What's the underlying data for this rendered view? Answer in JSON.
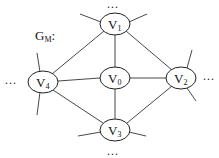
{
  "graph": {
    "label": {
      "main": "G",
      "sub": "M",
      "suffix": ":"
    },
    "nodes": [
      {
        "id": "v0",
        "main": "V",
        "sub": "0"
      },
      {
        "id": "v1",
        "main": "V",
        "sub": "1"
      },
      {
        "id": "v2",
        "main": "V",
        "sub": "2"
      },
      {
        "id": "v3",
        "main": "V",
        "sub": "3"
      },
      {
        "id": "v4",
        "main": "V",
        "sub": "4"
      }
    ],
    "edges": [
      [
        "v1",
        "v0"
      ],
      [
        "v1",
        "v4"
      ],
      [
        "v1",
        "v2"
      ],
      [
        "v4",
        "v0"
      ],
      [
        "v0",
        "v2"
      ],
      [
        "v0",
        "v3"
      ],
      [
        "v4",
        "v3"
      ],
      [
        "v2",
        "v3"
      ]
    ],
    "ellipsis": {
      "top": "...",
      "left": "...",
      "right": "...",
      "bottom": "..."
    }
  }
}
